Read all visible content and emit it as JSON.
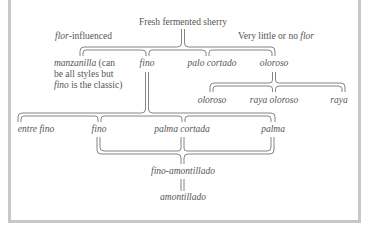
{
  "diagram": {
    "root": "Fresh fermented sherry",
    "group_labels": {
      "left": {
        "emph": "flor",
        "rest": "-influenced"
      },
      "right": {
        "rest": "Very little or no ",
        "emph": "flor"
      }
    },
    "level1": {
      "manzanilla": {
        "name": "manzanilla",
        "note1": " (can",
        "note2": "be all styles but",
        "note3_emph": "fino",
        "note3_rest": " is the classic)"
      },
      "fino": "fino",
      "palo_cortado": "palo cortado",
      "oloroso": "oloroso"
    },
    "oloroso_children": [
      "oloroso",
      "raya oloroso",
      "raya"
    ],
    "fino_children": [
      "entre fino",
      "fino",
      "palma cortada",
      "palma"
    ],
    "merge_result": "fino-amontillado",
    "final": "amontillado"
  }
}
